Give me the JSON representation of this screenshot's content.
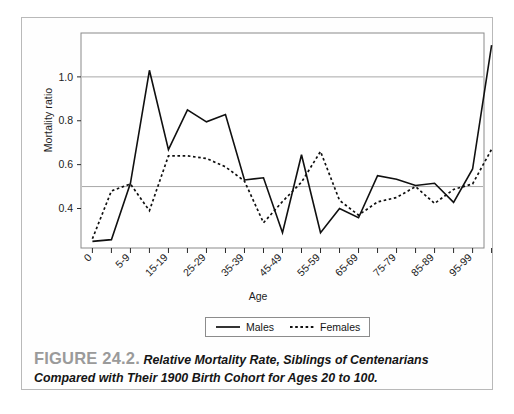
{
  "figure": {
    "number_label": "FIGURE 24.2.",
    "caption_line1": "Relative Mortality Rate, Siblings of Centenarians",
    "caption_line2": "Compared with Their 1900 Birth Cohort for Ages 20 to 100.",
    "caption_full": "Relative Mortality Rate, Siblings of Centenarians Compared with Their 1900 Birth Cohort for Ages 20 to 100."
  },
  "legend": {
    "position": "below-axis",
    "entries": [
      {
        "label": "Males",
        "style": "solid",
        "color": "#101010"
      },
      {
        "label": "Females",
        "style": "dotted",
        "color": "#101010"
      }
    ]
  },
  "colors": {
    "males_line": "#101010",
    "females_line": "#101010",
    "gridline": "#a8a8a8",
    "axis": "#2a2a2a",
    "frame": "#8a8a8a",
    "figure_border": "#b9b9b9",
    "fignum_gray": "#9a9a9a",
    "background": "#ffffff"
  },
  "chart_data": {
    "type": "line",
    "title": "",
    "xlabel": "Age",
    "ylabel": "Mortality ratio",
    "xlim": [
      -0.6,
      20.6
    ],
    "ylim": [
      0.22,
      1.2
    ],
    "grid": true,
    "gridlines_y": [
      0.5,
      1.0
    ],
    "ytick_values": [
      0.4,
      0.6,
      0.8,
      1.0
    ],
    "ytick_labels": [
      "0.4",
      "0.6",
      "0.8",
      "1.0"
    ],
    "x_categories": [
      "0",
      "1-4",
      "5-9",
      "10-14",
      "15-19",
      "20-24",
      "25-29",
      "30-34",
      "35-39",
      "40-44",
      "45-49",
      "50-54",
      "55-59",
      "60-64",
      "65-69",
      "70-74",
      "75-79",
      "80-84",
      "85-89",
      "90-94",
      "95-99",
      "100+"
    ],
    "xtick_labels_shown": [
      {
        "index": 0,
        "label": "0"
      },
      {
        "index": 2,
        "label": "5-9"
      },
      {
        "index": 4,
        "label": "15-19"
      },
      {
        "index": 6,
        "label": "25-29"
      },
      {
        "index": 8,
        "label": "35-39"
      },
      {
        "index": 10,
        "label": "45-49"
      },
      {
        "index": 12,
        "label": "55-59"
      },
      {
        "index": 14,
        "label": "65-69"
      },
      {
        "index": 16,
        "label": "75-79"
      },
      {
        "index": 18,
        "label": "85-89"
      },
      {
        "index": 20,
        "label": "95-99"
      }
    ],
    "series": [
      {
        "name": "Males",
        "style": "solid",
        "values": [
          0.25,
          0.258,
          0.515,
          1.03,
          0.668,
          0.85,
          0.795,
          0.828,
          0.53,
          0.54,
          0.29,
          0.645,
          0.29,
          0.4,
          0.358,
          0.55,
          0.533,
          0.505,
          0.515,
          0.428,
          0.58,
          1.145
        ]
      },
      {
        "name": "Females",
        "style": "dotted",
        "values": [
          0.262,
          0.48,
          0.512,
          0.39,
          0.64,
          0.64,
          0.628,
          0.59,
          0.525,
          0.335,
          0.432,
          0.52,
          0.66,
          0.437,
          0.37,
          0.43,
          0.45,
          0.5,
          0.423,
          0.487,
          0.512,
          0.67
        ]
      }
    ]
  }
}
